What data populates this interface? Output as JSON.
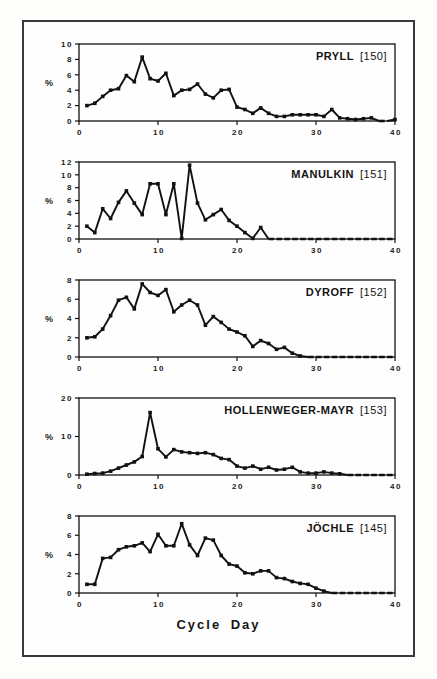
{
  "figure": {
    "x_axis_label": "Cycle Day",
    "background": "#fefefe",
    "frame_color": "#3a3a3a",
    "line_color": "#111111"
  },
  "chart_data": [
    {
      "type": "line",
      "id": "pryll",
      "name": "PRYLL",
      "ref": "[150]",
      "ylabel": "%",
      "xmax": 40,
      "xticks": [
        0,
        10,
        20,
        30,
        40
      ],
      "ymax": 10,
      "yticks": [
        0,
        2,
        4,
        6,
        8,
        10
      ],
      "x_range": [
        1,
        40
      ],
      "values": [
        2.0,
        2.3,
        3.2,
        4.0,
        4.2,
        5.9,
        5.1,
        8.3,
        5.5,
        5.2,
        6.2,
        3.3,
        4.0,
        4.1,
        4.8,
        3.5,
        3.0,
        4.0,
        4.1,
        1.8,
        1.5,
        1.0,
        1.7,
        1.0,
        0.6,
        0.6,
        0.8,
        0.8,
        0.8,
        0.8,
        0.6,
        1.5,
        0.4,
        0.3,
        0.2,
        0.3,
        0.4,
        0.0,
        0.0,
        0.2
      ]
    },
    {
      "type": "line",
      "id": "manulkin",
      "name": "MANULKIN",
      "ref": "[151]",
      "ylabel": "%",
      "xmax": 40,
      "xticks": [
        0,
        10,
        20,
        30,
        40
      ],
      "ymax": 12,
      "yticks": [
        0,
        2,
        4,
        6,
        8,
        10,
        12
      ],
      "x_range": [
        1,
        40
      ],
      "values": [
        2.0,
        1.0,
        4.7,
        3.2,
        5.7,
        7.5,
        5.6,
        3.8,
        8.6,
        8.6,
        3.8,
        8.6,
        0.1,
        11.5,
        5.6,
        3.0,
        3.8,
        4.6,
        2.9,
        2.0,
        1.0,
        0.1,
        1.8,
        0,
        0,
        0,
        0,
        0,
        0,
        0,
        0,
        0,
        0,
        0,
        0,
        0,
        0,
        0,
        0,
        0
      ]
    },
    {
      "type": "line",
      "id": "dyroff",
      "name": "DYROFF",
      "ref": "[152]",
      "ylabel": "%",
      "xmax": 40,
      "xticks": [
        0,
        10,
        20,
        30,
        40
      ],
      "ymax": 8,
      "yticks": [
        0,
        2,
        4,
        6,
        8
      ],
      "x_range": [
        1,
        40
      ],
      "values": [
        2.0,
        2.1,
        2.9,
        4.3,
        5.9,
        6.2,
        5.0,
        7.6,
        6.7,
        6.4,
        7.0,
        4.7,
        5.4,
        5.9,
        5.4,
        3.3,
        4.2,
        3.6,
        2.9,
        2.6,
        2.2,
        1.1,
        1.7,
        1.4,
        0.8,
        1.0,
        0.4,
        0.1,
        0,
        0,
        0,
        0,
        0,
        0,
        0,
        0,
        0,
        0,
        0,
        0
      ]
    },
    {
      "type": "line",
      "id": "hollenweger-mayr",
      "name": "HOLLENWEGER-MAYR",
      "ref": "[153]",
      "ylabel": "%",
      "xmax": 40,
      "xticks": [
        0,
        10,
        20,
        30,
        40
      ],
      "ymax": 20,
      "yticks": [
        0,
        10,
        20
      ],
      "x_range": [
        1,
        40
      ],
      "values": [
        0.2,
        0.4,
        0.5,
        1.0,
        1.8,
        2.6,
        3.4,
        4.8,
        16.2,
        6.8,
        4.7,
        6.6,
        6.0,
        5.8,
        5.6,
        5.8,
        5.3,
        4.3,
        4.0,
        2.3,
        1.8,
        2.3,
        1.5,
        2.0,
        1.3,
        1.5,
        2.0,
        0.8,
        0.5,
        0.5,
        0.8,
        0.5,
        0.3,
        0,
        0,
        0,
        0,
        0,
        0,
        0
      ]
    },
    {
      "type": "line",
      "id": "jochle",
      "name": "JÖCHLE",
      "ref": "[145]",
      "ylabel": "%",
      "xmax": 40,
      "xticks": [
        0,
        10,
        20,
        30,
        40
      ],
      "ymax": 8,
      "yticks": [
        0,
        2,
        4,
        6,
        8
      ],
      "x_range": [
        1,
        40
      ],
      "values": [
        0.9,
        0.9,
        3.6,
        3.7,
        4.5,
        4.8,
        4.9,
        5.2,
        4.3,
        6.1,
        4.9,
        4.9,
        7.2,
        5.0,
        3.9,
        5.7,
        5.5,
        3.9,
        3.0,
        2.8,
        2.1,
        2.0,
        2.3,
        2.3,
        1.6,
        1.5,
        1.2,
        1.0,
        0.9,
        0.5,
        0.2,
        0,
        0,
        0,
        0,
        0,
        0,
        0,
        0,
        0
      ]
    }
  ]
}
